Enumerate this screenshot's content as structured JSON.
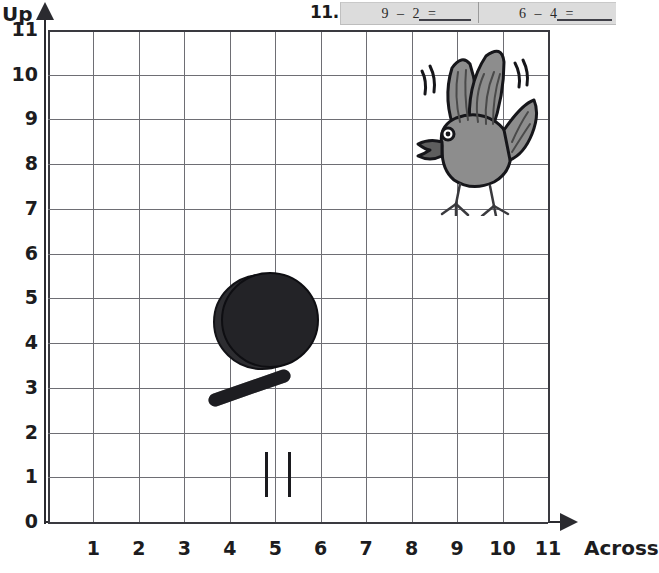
{
  "header": {
    "problem_number": "11.",
    "problems": [
      {
        "id": "a",
        "text": "9  –  2  =",
        "blank": true
      },
      {
        "id": "b",
        "text": "6  –  4  =",
        "blank": true
      }
    ],
    "box_color": "#dcdcdc"
  },
  "graph": {
    "y_axis_title": "Up",
    "x_axis_title": "Across",
    "y_labels": [
      "11",
      "10",
      "9",
      "8",
      "7",
      "6",
      "5",
      "4",
      "3",
      "2",
      "1",
      "0"
    ],
    "x_labels": [
      "1",
      "2",
      "3",
      "4",
      "5",
      "6",
      "7",
      "8",
      "9",
      "10",
      "11"
    ],
    "x_min": 0,
    "x_max": 11,
    "y_min": 0,
    "y_max": 11,
    "grid": true,
    "grid_color": "#6e6e74",
    "axis_color": "#2b2b30"
  },
  "objects": [
    {
      "name": "bird",
      "label": "flying bird",
      "color": "#8a8a8a",
      "outline": "#1a1a1a",
      "grid_x": 9.5,
      "grid_y": 9.3
    },
    {
      "name": "frying-pan",
      "label": "frying pan",
      "color": "#232326",
      "outline": "#0e0e10",
      "grid_x": 5,
      "grid_y": 5
    },
    {
      "name": "stove-flames",
      "label": "burner bars",
      "color": "#1a1a1e",
      "grid_x": 5,
      "grid_y": 1.5
    }
  ],
  "chart_data": {
    "type": "scatter",
    "title": "",
    "xlabel": "Across",
    "ylabel": "Up",
    "xlim": [
      0,
      11
    ],
    "ylim": [
      0,
      11
    ],
    "grid": true,
    "categories": [
      "bird",
      "frying-pan",
      "stove-flames"
    ],
    "points": [
      {
        "label": "bird",
        "x": 9.5,
        "y": 9.3
      },
      {
        "label": "frying-pan",
        "x": 5,
        "y": 5
      },
      {
        "label": "stove-flames",
        "x": 5,
        "y": 1.5
      }
    ]
  }
}
